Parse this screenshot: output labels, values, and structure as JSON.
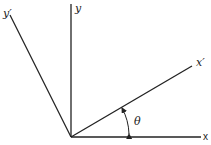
{
  "diagram": {
    "colors": {
      "line": "#222222",
      "background": "#ffffff"
    },
    "labels": {
      "x": "x",
      "y": "y",
      "x_prime": "x′",
      "y_prime": "y′",
      "theta": "θ"
    },
    "axes": [
      {
        "id": "x",
        "from": [
          71,
          137
        ],
        "to": [
          200,
          137
        ]
      },
      {
        "id": "y",
        "from": [
          71,
          137
        ],
        "to": [
          71,
          5
        ]
      },
      {
        "id": "x_prime",
        "from": [
          71,
          137
        ],
        "to": [
          193,
          66
        ]
      },
      {
        "id": "y_prime",
        "from": [
          71,
          137
        ],
        "to": [
          10,
          15
        ]
      }
    ],
    "angle_arc": {
      "between": [
        "x",
        "x_prime"
      ],
      "label": "θ"
    }
  }
}
